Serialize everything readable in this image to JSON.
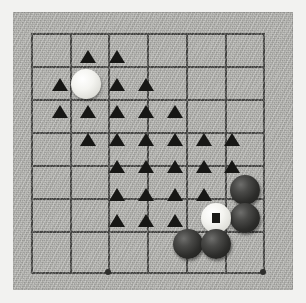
{
  "diagram": {
    "board": {
      "background_color": "#b8b8b4",
      "line_color": "#4a4a48",
      "margin_color": "#f2f2f0",
      "columns": 7,
      "rows": 8,
      "col_x": [
        31,
        70,
        108,
        147,
        186,
        225,
        263
      ],
      "row_y": [
        33,
        59,
        85,
        111,
        140,
        166,
        192,
        218,
        244,
        272
      ],
      "grid_h_lines_y": [
        33,
        66,
        99,
        132,
        165,
        198,
        231,
        272
      ],
      "grid_v_lines_x": [
        31,
        70,
        108,
        147,
        186,
        225,
        263
      ]
    },
    "star_points": [
      {
        "label": "hoshi-left",
        "x": 108,
        "y": 272
      },
      {
        "label": "hoshi-right",
        "x": 263,
        "y": 272
      }
    ],
    "stones": [
      {
        "color": "white",
        "x": 86,
        "y": 84,
        "mark": ""
      },
      {
        "color": "black",
        "x": 245,
        "y": 190,
        "mark": ""
      },
      {
        "color": "black",
        "x": 245,
        "y": 218,
        "mark": ""
      },
      {
        "color": "white",
        "x": 216,
        "y": 218,
        "mark": "square"
      },
      {
        "color": "black",
        "x": 188,
        "y": 244,
        "mark": ""
      },
      {
        "color": "black",
        "x": 216,
        "y": 244,
        "mark": ""
      }
    ],
    "triangle_marks": [
      {
        "x": 88,
        "y": 58
      },
      {
        "x": 117,
        "y": 58
      },
      {
        "x": 60,
        "y": 86
      },
      {
        "x": 117,
        "y": 86
      },
      {
        "x": 146,
        "y": 86
      },
      {
        "x": 60,
        "y": 113
      },
      {
        "x": 88,
        "y": 113
      },
      {
        "x": 117,
        "y": 113
      },
      {
        "x": 146,
        "y": 113
      },
      {
        "x": 175,
        "y": 113
      },
      {
        "x": 88,
        "y": 141
      },
      {
        "x": 117,
        "y": 141
      },
      {
        "x": 146,
        "y": 141
      },
      {
        "x": 175,
        "y": 141
      },
      {
        "x": 204,
        "y": 141
      },
      {
        "x": 232,
        "y": 141
      },
      {
        "x": 117,
        "y": 168
      },
      {
        "x": 146,
        "y": 168
      },
      {
        "x": 175,
        "y": 168
      },
      {
        "x": 204,
        "y": 168
      },
      {
        "x": 232,
        "y": 168
      },
      {
        "x": 117,
        "y": 196
      },
      {
        "x": 146,
        "y": 196
      },
      {
        "x": 175,
        "y": 196
      },
      {
        "x": 204,
        "y": 196
      },
      {
        "x": 117,
        "y": 222
      },
      {
        "x": 146,
        "y": 222
      },
      {
        "x": 175,
        "y": 222
      }
    ],
    "marked_stone_label": "1"
  }
}
